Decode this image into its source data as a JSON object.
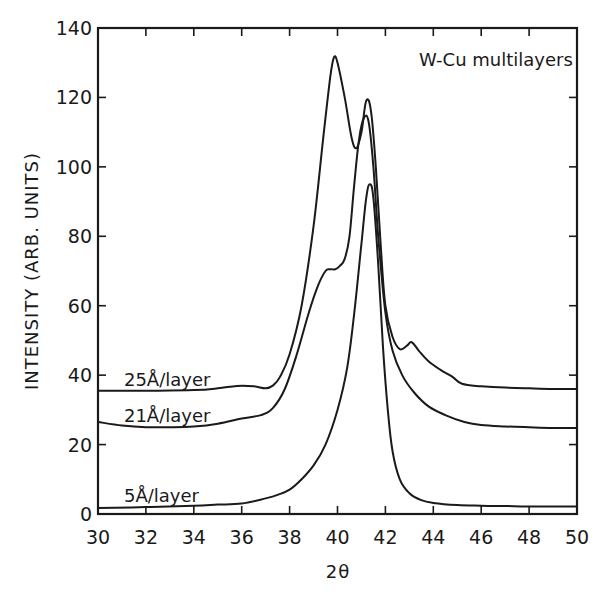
{
  "chart_data": {
    "type": "line",
    "title": "W-Cu multilayers",
    "xlabel": "2θ",
    "ylabel": "INTENSITY   (ARB. UNITS)",
    "xlim": [
      30,
      50
    ],
    "ylim": [
      0,
      140
    ],
    "xticks": [
      30,
      32,
      34,
      36,
      38,
      40,
      42,
      44,
      46,
      48,
      50
    ],
    "yticks": [
      0,
      20,
      40,
      60,
      80,
      100,
      120,
      140
    ],
    "grid": false,
    "legend": "inline curve labels",
    "series": [
      {
        "name": "25Å/layer",
        "label_pos": [
          31,
          39
        ],
        "x": [
          30,
          32,
          34,
          35,
          35.8,
          36.5,
          37.0,
          37.3,
          37.6,
          38.0,
          38.5,
          39.0,
          39.4,
          39.7,
          39.85,
          40.0,
          40.3,
          40.6,
          40.8,
          41.0,
          41.2,
          41.4,
          41.6,
          41.8,
          42.0,
          42.3,
          42.6,
          42.9,
          43.1,
          43.4,
          43.8,
          44.3,
          44.8,
          45.2,
          46,
          47,
          48,
          49,
          50
        ],
        "values": [
          35.5,
          35.5,
          35.7,
          36.2,
          36.9,
          36.8,
          36.2,
          37.0,
          39.5,
          46,
          60,
          83,
          108,
          126,
          131.5,
          130,
          120,
          108,
          105.5,
          110,
          119,
          116,
          100,
          78,
          60,
          51,
          47.5,
          48.5,
          49.5,
          47,
          44,
          41.5,
          39.5,
          37.5,
          36.8,
          36.4,
          36.2,
          36.0,
          36.0
        ]
      },
      {
        "name": "21Å/layer",
        "label_pos": [
          31,
          28.5
        ],
        "x": [
          30,
          31,
          32,
          33,
          34,
          35,
          36,
          36.8,
          37.3,
          37.8,
          38.3,
          38.8,
          39.2,
          39.5,
          39.7,
          39.9,
          40.1,
          40.3,
          40.5,
          40.7,
          40.9,
          41.1,
          41.3,
          41.5,
          41.7,
          42.0,
          42.3,
          42.7,
          43.2,
          43.8,
          44.5,
          45.3,
          46,
          47,
          48,
          49,
          50
        ],
        "values": [
          26.5,
          25.5,
          25.0,
          25.0,
          25.2,
          26.0,
          27.5,
          28.5,
          30.5,
          36,
          46,
          58,
          66,
          70,
          70.5,
          70.5,
          71.5,
          73.5,
          80,
          95,
          108,
          114,
          113,
          100,
          80,
          58,
          47,
          40,
          35,
          31,
          28.5,
          26.5,
          25.6,
          25.2,
          25.0,
          24.8,
          24.8
        ]
      },
      {
        "name": "5Å/layer",
        "label_pos": [
          31,
          5.5
        ],
        "x": [
          30,
          32,
          34,
          35,
          36,
          37,
          37.5,
          38,
          38.5,
          39,
          39.5,
          40,
          40.4,
          40.7,
          41.0,
          41.2,
          41.35,
          41.5,
          41.7,
          41.9,
          42.1,
          42.3,
          42.6,
          43,
          43.5,
          44,
          45,
          46,
          47,
          48,
          50
        ],
        "values": [
          1.7,
          2.0,
          2.4,
          2.7,
          3.0,
          4.5,
          5.5,
          7,
          10,
          14,
          20,
          30,
          42,
          58,
          78,
          91,
          95,
          91,
          72,
          48,
          30,
          18,
          10,
          6,
          4,
          3.2,
          2.6,
          2.4,
          2.3,
          2.2,
          2.2
        ]
      }
    ]
  },
  "annotations": {
    "title_text": "W-Cu  multilayers",
    "curve_labels": [
      "25Å/layer",
      "21Å/layer",
      "5Å/layer"
    ],
    "xlabel_text": "2θ",
    "ylabel_text": "INTENSITY   (ARB. UNITS)"
  },
  "style": {
    "line_color": "#1a1a1a",
    "background": "#ffffff"
  }
}
